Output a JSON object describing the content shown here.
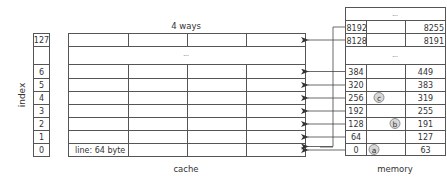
{
  "index": {
    "axis_label": "index",
    "rows": [
      "127",
      "",
      "6",
      "5",
      "4",
      "3",
      "2",
      "1",
      "0"
    ]
  },
  "cache": {
    "title": "4 ways",
    "ellipsis": "...",
    "line_label": "line: 64 byte",
    "caption": "cache"
  },
  "memory": {
    "caption": "memory",
    "top_ellipsis": "...",
    "mid_ellipsis": "...",
    "rows": [
      {
        "start": "8192",
        "end": "8255",
        "marker": ""
      },
      {
        "start": "8128",
        "end": "8191",
        "marker": ""
      },
      {
        "start": "384",
        "end": "449",
        "marker": ""
      },
      {
        "start": "320",
        "end": "383",
        "marker": ""
      },
      {
        "start": "256",
        "end": "319",
        "marker": "c"
      },
      {
        "start": "192",
        "end": "255",
        "marker": ""
      },
      {
        "start": "128",
        "end": "191",
        "marker": "b"
      },
      {
        "start": "64",
        "end": "127",
        "marker": ""
      },
      {
        "start": "0",
        "end": "63",
        "marker": "a"
      }
    ]
  },
  "colors": {
    "line": "#555555",
    "text": "#333333",
    "marker_fill": "#d8d8d8"
  }
}
